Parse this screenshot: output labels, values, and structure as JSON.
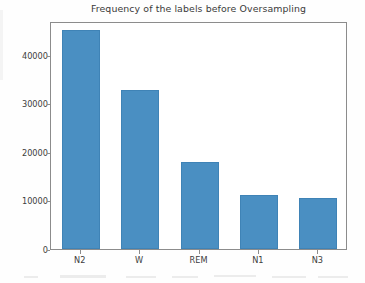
{
  "chart_data": {
    "type": "bar",
    "title": "Frequency of the labels before Oversampling",
    "xlabel": "",
    "ylabel": "",
    "categories": [
      "N2",
      "W",
      "REM",
      "N1",
      "N3"
    ],
    "values": [
      45100,
      32700,
      17900,
      11200,
      10600
    ],
    "ylim": [
      0,
      47000
    ],
    "yticks": [
      0,
      10000,
      20000,
      30000,
      40000
    ],
    "ytick_labels": [
      "0",
      "10000",
      "20000",
      "30000",
      "40000"
    ],
    "grid": false,
    "legend": null,
    "bar_color": "#4a8fc2",
    "bar_edge_color": "#3f83b6",
    "axis_color": "#8c8c8c",
    "text_color": "#3d3d3d"
  },
  "figure": {
    "background": "#fefefe",
    "plot_background": "#ffffff"
  }
}
